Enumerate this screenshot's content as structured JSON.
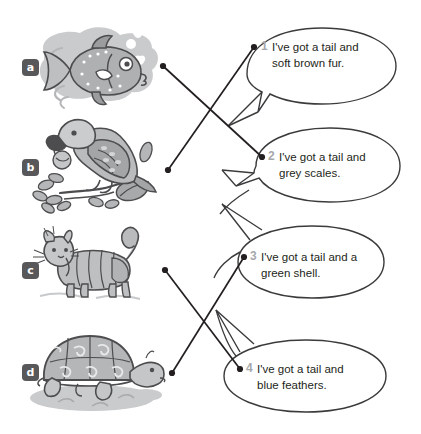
{
  "page": {
    "width": 421,
    "height": 434,
    "background": "#ffffff"
  },
  "colors": {
    "label_background": "#58585a",
    "label_text": "#ffffff",
    "number_text": "#a6a8ab",
    "body_text": "#231f20",
    "line": "#231f20",
    "art_grey_dark": "#8a8c8e",
    "art_grey_mid": "#a7a9ac",
    "art_grey_light": "#c7c9cb",
    "art_grey_pale": "#d9dadb",
    "bubble_outline": "#3b3b3d"
  },
  "animals": [
    {
      "label": "a",
      "name": "fish",
      "icon": "fish-icon",
      "label_x": 22,
      "label_y": 59,
      "connector_dot": {
        "x": 163,
        "y": 66
      }
    },
    {
      "label": "b",
      "name": "parrot",
      "icon": "parrot-icon",
      "label_x": 22,
      "label_y": 159,
      "connector_dot": {
        "x": 168,
        "y": 170
      }
    },
    {
      "label": "c",
      "name": "cat",
      "icon": "cat-icon",
      "label_x": 22,
      "label_y": 262,
      "connector_dot": {
        "x": 165,
        "y": 270
      }
    },
    {
      "label": "d",
      "name": "tortoise",
      "icon": "tortoise-icon",
      "label_x": 22,
      "label_y": 364,
      "connector_dot": {
        "x": 172,
        "y": 373
      }
    }
  ],
  "bubbles": [
    {
      "number": "1",
      "text": "I've got a tail and\nsoft brown fur.",
      "line1": "I've got a tail and",
      "line2": "soft brown fur.",
      "num_x": 261,
      "num_y": 41,
      "text_x": 272,
      "text_y": 39,
      "dot": {
        "x": 254,
        "y": 47
      }
    },
    {
      "number": "2",
      "text": "I've got a tail and\ngrey scales.",
      "line1": "I've got a tail and",
      "line2": "grey scales.",
      "num_x": 268,
      "num_y": 151,
      "text_x": 279,
      "text_y": 149,
      "dot": {
        "x": 262,
        "y": 157
      }
    },
    {
      "number": "3",
      "text": "I've got a tail and a\ngreen shell.",
      "line1": "I've got a tail and a",
      "line2": "green shell.",
      "num_x": 250,
      "num_y": 251,
      "text_x": 261,
      "text_y": 249,
      "dot": {
        "x": 244,
        "y": 257
      }
    },
    {
      "number": "4",
      "text": "I've got a tail and\nblue feathers.",
      "line1": "I've got a tail and",
      "line2": "blue feathers.",
      "num_x": 246,
      "num_y": 363,
      "text_x": 257,
      "text_y": 361,
      "dot": {
        "x": 240,
        "y": 369
      }
    }
  ],
  "connections": [
    {
      "from": "a",
      "to": "2",
      "description": "fish to grey scales"
    },
    {
      "from": "b",
      "to": "1",
      "description": "parrot to soft brown fur"
    },
    {
      "from": "c",
      "to": "4",
      "description": "cat to blue feathers"
    },
    {
      "from": "d",
      "to": "3",
      "description": "tortoise to green shell"
    }
  ]
}
